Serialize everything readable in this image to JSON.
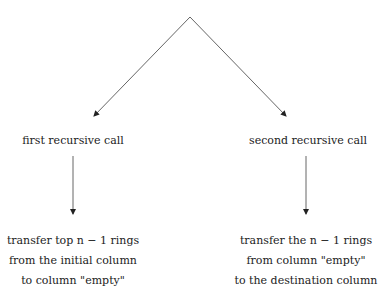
{
  "diagram": {
    "nodes": [
      {
        "id": "first",
        "label": "first recursive call"
      },
      {
        "id": "second",
        "label": "second recursive call"
      },
      {
        "id": "first_action",
        "lines": [
          "transfer top n − 1 rings",
          "from the initial column",
          "to column \"empty\""
        ]
      },
      {
        "id": "second_action",
        "lines": [
          "transfer the n − 1 rings",
          "from column \"empty\"",
          "to the destination column"
        ]
      }
    ],
    "edges": [
      {
        "from": "root",
        "to": "first"
      },
      {
        "from": "root",
        "to": "second"
      },
      {
        "from": "first",
        "to": "first_action"
      },
      {
        "from": "second",
        "to": "second_action"
      }
    ],
    "colors": {
      "line": "#555555",
      "text": "#222222"
    }
  }
}
